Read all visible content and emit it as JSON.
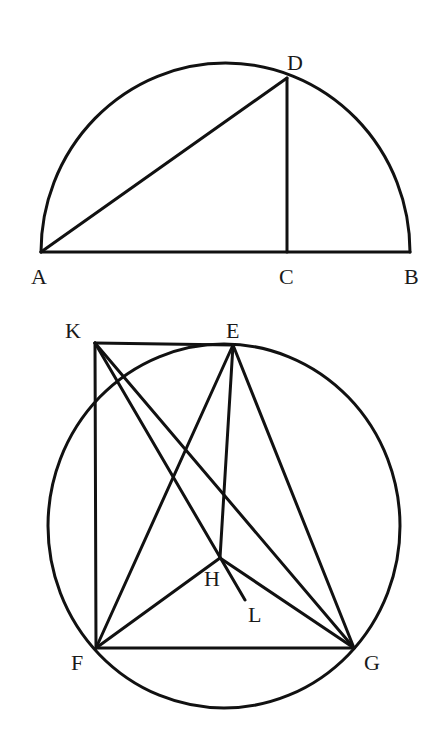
{
  "figures": [
    {
      "id": "semicircle",
      "description": "Semicircle on diameter AB with perpendicular CD",
      "points": {
        "A": {
          "label": "A"
        },
        "B": {
          "label": "B"
        },
        "C": {
          "label": "C"
        },
        "D": {
          "label": "D"
        }
      },
      "segments": [
        [
          "A",
          "B"
        ],
        [
          "A",
          "D"
        ],
        [
          "C",
          "D"
        ]
      ],
      "arcs": [
        {
          "from": "A",
          "to": "B",
          "type": "semicircle"
        }
      ]
    },
    {
      "id": "circle-construction",
      "description": "Circle through E, F, G with auxiliary point K, H and L",
      "points": {
        "K": {
          "label": "K"
        },
        "E": {
          "label": "E"
        },
        "F": {
          "label": "F"
        },
        "G": {
          "label": "G"
        },
        "H": {
          "label": "H"
        },
        "L": {
          "label": "L"
        }
      },
      "segments": [
        [
          "K",
          "E"
        ],
        [
          "K",
          "F"
        ],
        [
          "K",
          "G"
        ],
        [
          "K",
          "L"
        ],
        [
          "E",
          "F"
        ],
        [
          "E",
          "H"
        ],
        [
          "E",
          "G"
        ],
        [
          "F",
          "G"
        ],
        [
          "F",
          "H"
        ],
        [
          "H",
          "G"
        ]
      ],
      "circles": [
        {
          "through": [
            "E",
            "F",
            "G"
          ]
        }
      ]
    }
  ],
  "colors": {
    "stroke": "#111111",
    "background": "#ffffff"
  }
}
